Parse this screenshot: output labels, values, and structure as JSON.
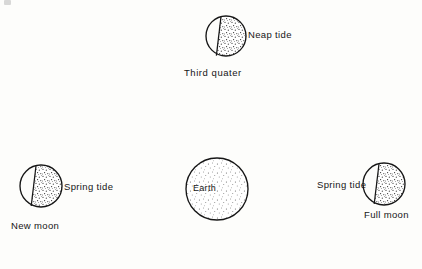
{
  "figure": {
    "kind": "astronomy-diagram",
    "background_color": "#fdfdfb",
    "ink_color": "#161616",
    "stipple_color": "#3a3a3a"
  },
  "bodies": {
    "third_quarter_moon": {
      "name_label": "Third  quater",
      "tide_label": "Neap tide",
      "center": {
        "x": 226,
        "y": 36
      },
      "radius": 20,
      "terminator_tilt_deg": 12,
      "shaded_side": "right",
      "stipple_density": "heavy"
    },
    "new_moon": {
      "name_label": "New moon",
      "tide_label": "Spring tide",
      "center": {
        "x": 41,
        "y": 186
      },
      "radius": 21,
      "terminator_tilt_deg": 12,
      "shaded_side": "right",
      "stipple_density": "heavy"
    },
    "earth": {
      "name_label": "Earth",
      "center": {
        "x": 217,
        "y": 189
      },
      "radius": 31,
      "shaded_side": "right",
      "stipple_density": "light"
    },
    "full_moon": {
      "name_label": "Full moon",
      "tide_label": "Spring tide",
      "center": {
        "x": 384,
        "y": 184
      },
      "radius": 21,
      "terminator_tilt_deg": 12,
      "shaded_side": "right",
      "stipple_density": "heavy"
    }
  },
  "labels": {
    "neap_tide": "Neap tide",
    "third_quarter": "Third  quater",
    "spring_tide_left": "Spring tide",
    "new_moon": "New moon",
    "earth": "Earth",
    "spring_tide_right": "Spring tide",
    "full_moon": "Full moon"
  }
}
